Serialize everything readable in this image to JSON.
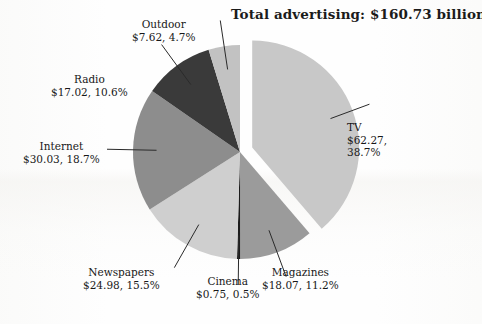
{
  "title": "Total advertising: $160.73 billion",
  "chart_data": {
    "type": "pie",
    "title": "Total advertising: $160.73 billion",
    "total_label": "$160.73 billion",
    "total_value": 160.73,
    "units": "billion USD",
    "legend": "none (direct labels with leader lines)",
    "grid": false,
    "explode": [
      "TV"
    ],
    "start_angle_deg": 0,
    "direction": "clockwise",
    "categories": [
      "TV",
      "Magazines",
      "Cinema",
      "Newspapers",
      "Internet",
      "Radio",
      "Outdoor"
    ],
    "values": [
      62.27,
      18.07,
      0.75,
      24.98,
      30.03,
      17.02,
      7.62
    ],
    "percents": [
      38.7,
      11.2,
      0.5,
      15.5,
      18.7,
      10.6,
      4.7
    ],
    "slices": [
      {
        "name": "TV",
        "value": 62.27,
        "percent": 38.7,
        "label_name": "TV",
        "label_value": "$62.27,",
        "label_value2": "38.7%",
        "color": "#c8c8c8",
        "exploded": true
      },
      {
        "name": "Magazines",
        "value": 18.07,
        "percent": 11.2,
        "label_name": "Magazines",
        "label_value": "$18.07, 11.2%",
        "color": "#9b9b9b",
        "exploded": false
      },
      {
        "name": "Cinema",
        "value": 0.75,
        "percent": 0.5,
        "label_name": "Cinema",
        "label_value": "$0.75, 0.5%",
        "color": "#1c1c1c",
        "exploded": false
      },
      {
        "name": "Newspapers",
        "value": 24.98,
        "percent": 15.5,
        "label_name": "Newspapers",
        "label_value": "$24.98, 15.5%",
        "color": "#cfcfcf",
        "exploded": false
      },
      {
        "name": "Internet",
        "value": 30.03,
        "percent": 18.7,
        "label_name": "Internet",
        "label_value": "$30.03, 18.7%",
        "color": "#8d8d8d",
        "exploded": false
      },
      {
        "name": "Radio",
        "value": 17.02,
        "percent": 10.6,
        "label_name": "Radio",
        "label_value": "$17.02, 10.6%",
        "color": "#3a3a3a",
        "exploded": false
      },
      {
        "name": "Outdoor",
        "value": 7.62,
        "percent": 4.7,
        "label_name": "Outdoor",
        "label_value": "$7.62, 4.7%",
        "color": "#c2c2c2",
        "exploded": false
      }
    ]
  },
  "colors": {
    "background": "#fefefe",
    "text": "#181818",
    "leader_line": "#2a2a2a"
  }
}
